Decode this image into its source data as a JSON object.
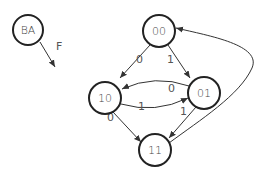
{
  "diagram": {
    "type": "state-transition",
    "legend": {
      "node_label": "BA",
      "edge_label": "F"
    },
    "nodes": [
      {
        "id": "00",
        "label": "00"
      },
      {
        "id": "10",
        "label": "10"
      },
      {
        "id": "01",
        "label": "01"
      },
      {
        "id": "11",
        "label": "11"
      }
    ],
    "edges": [
      {
        "from": "00",
        "to": "10",
        "label": "0"
      },
      {
        "from": "00",
        "to": "01",
        "label": "1"
      },
      {
        "from": "01",
        "to": "10",
        "label": "0"
      },
      {
        "from": "10",
        "to": "01",
        "label": "1"
      },
      {
        "from": "10",
        "to": "11",
        "label": "0"
      },
      {
        "from": "01",
        "to": "11",
        "label": "1"
      },
      {
        "from": "11",
        "to": "00",
        "label": ""
      }
    ]
  }
}
